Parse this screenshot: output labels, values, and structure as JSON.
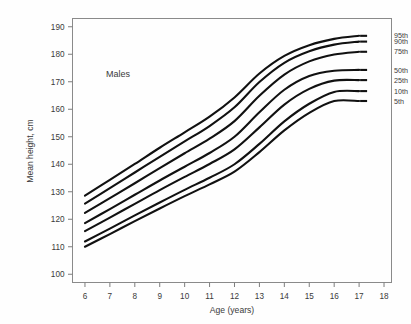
{
  "chart_data": {
    "type": "line",
    "title": "",
    "annotation": "Males",
    "xlabel": "Age (years)",
    "ylabel": "Mean height, cm",
    "xlim": [
      5.5,
      18.3
    ],
    "ylim": [
      97,
      193
    ],
    "grid": false,
    "legend_position": "right-inline",
    "xticks": [
      6,
      7,
      8,
      9,
      10,
      11,
      12,
      13,
      14,
      15,
      16,
      17,
      18
    ],
    "xtick_labels": [
      "6",
      "7",
      "8",
      "9",
      "10",
      "11",
      "12",
      "13",
      "14",
      "15",
      "16",
      "17",
      "18"
    ],
    "yticks": [
      100,
      110,
      120,
      130,
      140,
      150,
      160,
      170,
      180,
      190
    ],
    "ytick_labels": [
      "100",
      "110",
      "120",
      "130",
      "140",
      "150",
      "160",
      "170",
      "180",
      "190"
    ],
    "x": [
      6,
      7,
      8,
      9,
      10,
      11,
      12,
      13,
      14,
      15,
      16,
      17
    ],
    "series": [
      {
        "name": "95th",
        "label": "95th",
        "values": [
          128.6,
          134.3,
          140.1,
          146.0,
          151.6,
          157.3,
          164.3,
          173.0,
          179.4,
          183.3,
          185.6,
          186.7
        ]
      },
      {
        "name": "90th",
        "label": "90th",
        "values": [
          125.7,
          131.3,
          137.0,
          142.7,
          148.3,
          153.9,
          160.7,
          169.9,
          176.9,
          181.1,
          183.5,
          184.6
        ]
      },
      {
        "name": "75th",
        "label": "75th",
        "values": [
          122.3,
          127.7,
          133.1,
          138.6,
          144.0,
          149.3,
          155.7,
          164.9,
          172.6,
          177.4,
          179.9,
          180.9
        ]
      },
      {
        "name": "50th",
        "label": "50th",
        "values": [
          118.6,
          123.7,
          128.9,
          134.1,
          139.1,
          144.1,
          150.0,
          158.9,
          167.1,
          172.1,
          174.0,
          174.3
        ]
      },
      {
        "name": "25th",
        "label": "25th",
        "values": [
          115.7,
          120.6,
          125.6,
          130.6,
          135.4,
          140.1,
          145.4,
          153.4,
          161.7,
          167.4,
          170.4,
          170.6
        ]
      },
      {
        "name": "10th",
        "label": "10th",
        "values": [
          111.9,
          116.6,
          121.4,
          126.1,
          130.7,
          135.1,
          140.0,
          147.4,
          155.6,
          162.0,
          166.3,
          166.6
        ]
      },
      {
        "name": "5th",
        "label": "5th",
        "values": [
          110.0,
          114.6,
          119.3,
          123.9,
          128.4,
          132.7,
          137.3,
          144.4,
          152.3,
          158.7,
          163.0,
          163.0
        ]
      }
    ]
  },
  "figure": {
    "ylabel": "Mean height, cm",
    "xlabel": "Age (years)",
    "annotation": "Males",
    "line_color": "#111111",
    "axis_color": "#8a8a8a",
    "background": "#fefefe"
  }
}
